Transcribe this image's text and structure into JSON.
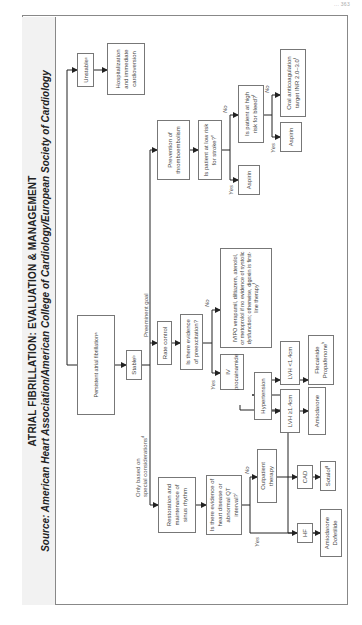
{
  "page_header": "...  363",
  "title": "ATRIAL FIBRILLATION: EVALUATION & MANAGEMENT",
  "source": "Source: American Heart Association/American College of Cardiology/European Society of Cardiology",
  "nodes": {
    "persistent_af": "Persistent atrial fibrillation",
    "stable": "Stable",
    "unstable": "Unstable",
    "hospitalization": "Hospitalization and immediate cardioversion",
    "rate_control": "Rate control",
    "restoration": "Restoration and maintenance of sinus rhythm",
    "prevention": "Prevention of thromboembolism",
    "low_risk_stroke": "Is patient at low risk for stroke?",
    "aspirin_1": "Aspirin",
    "high_risk_bleed": "Is patient at high risk for bleed?",
    "aspirin_2": "Aspirin",
    "oral_anticoag": "Oral anticoagulation target INR 2.0–3.0",
    "preexcitation": "Is there evidence of preexcitation?",
    "iv_procainamide": "IV procainamide",
    "iv_po_verapamil": "IV/PO verapamil, diltiazem, atenolol, or metoprolol if no evidence of systolic dysfunction; otherwise, digoxin is first-line therapy",
    "heart_disease": "Is there evidence of heart disease or abnormal QT interval?",
    "outpatient": "Outpatient therapy",
    "hf": "HF",
    "amio_dofet": "Amiodarone Dofetilide",
    "cad": "CAD",
    "sotalol": "Sotalol",
    "hypertension": "Hypertension",
    "lvh_ge": "LVH ≥1.4cm",
    "amiodarone": "Amiodarone",
    "lvh_lt": "LVH <1.4cm",
    "flec_prop": "Flecainide Propafenone"
  },
  "superscripts": {
    "persistent_af": "a",
    "stable": "b",
    "unstable": "c",
    "special": "d",
    "low_risk_stroke": "e",
    "high_risk_bleed": "f",
    "oral_anticoag": "f",
    "iv_po_verapamil": "f",
    "sotalol": "g",
    "flec_prop": "h",
    "heart_disease": "i"
  },
  "labels": {
    "preeminent_goal": "Preeminent goal",
    "only_based_on": "Only based on",
    "special_considerations": "special considerations",
    "yes": "Yes",
    "no": "No"
  }
}
